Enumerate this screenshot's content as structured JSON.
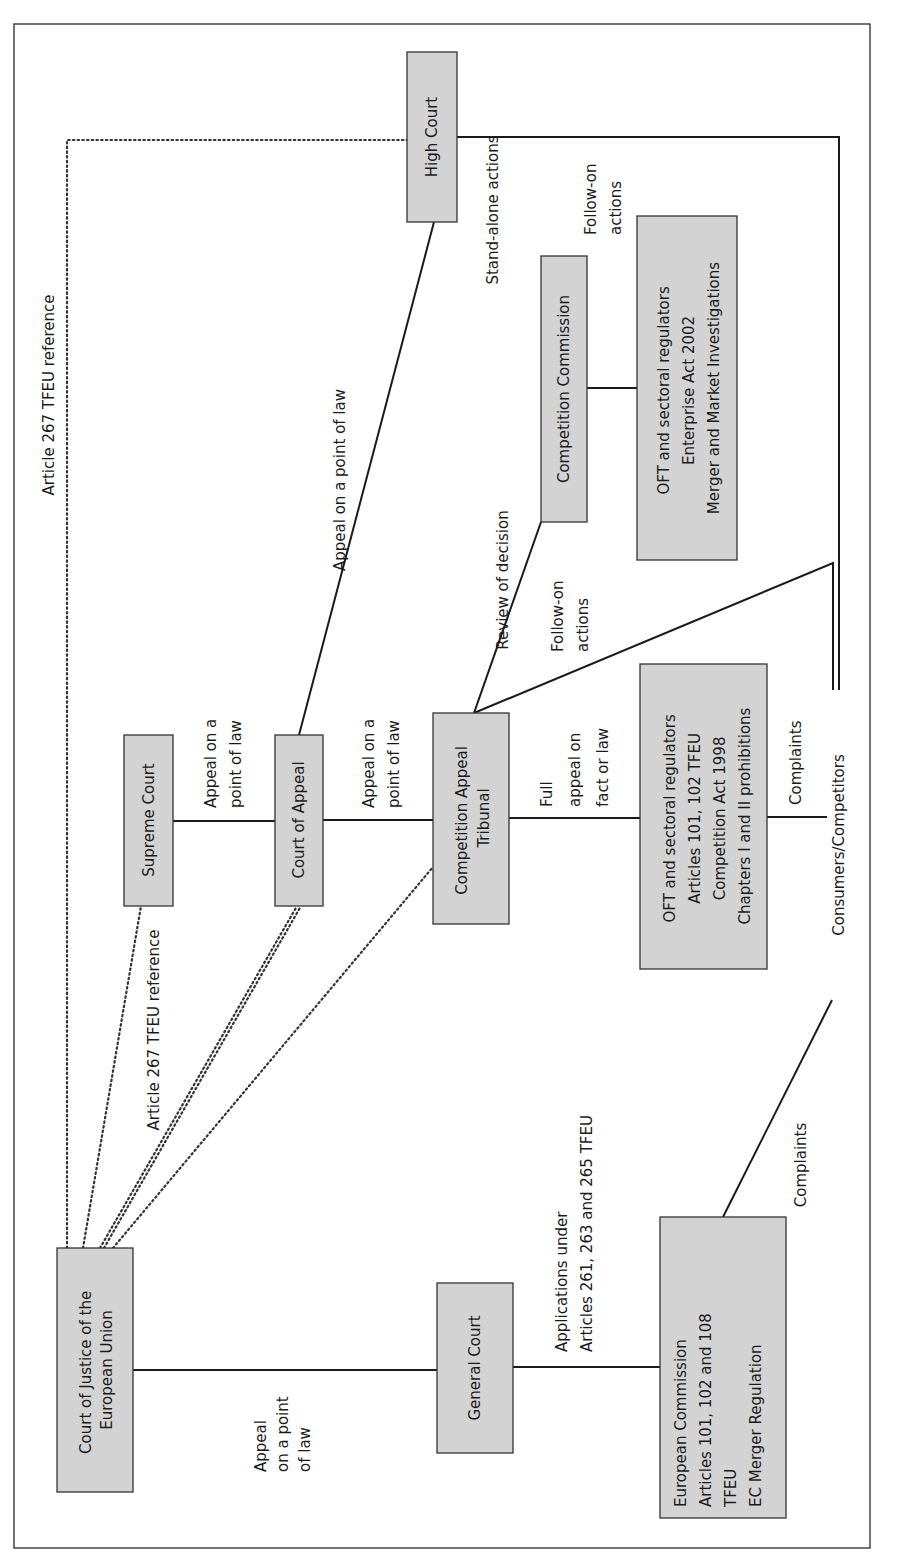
{
  "diagram": {
    "orientation": "rotated 90 degrees counter-clockwise",
    "colors": {
      "box_fill": "#d3d3d3",
      "line": "#1a1a1a",
      "background": "#ffffff"
    },
    "nodes": {
      "cjeu": {
        "lines": [
          "Court of Justice of the",
          "European Union"
        ]
      },
      "general_court": {
        "lines": [
          "General Court"
        ]
      },
      "european_commission": {
        "lines": [
          "European Commission",
          "Articles 101, 102 and 108",
          "TFEU",
          "EC Merger Regulation"
        ]
      },
      "supreme_court": {
        "lines": [
          "Supreme Court"
        ]
      },
      "court_of_appeal": {
        "lines": [
          "Court of Appeal"
        ]
      },
      "cat": {
        "lines": [
          "Competition Appeal",
          "Tribunal"
        ]
      },
      "oft_ca98": {
        "lines": [
          "OFT and sectoral regulators",
          "Articles 101, 102 TFEU",
          "Competition Act 1998",
          "Chapters I and II prohibitions"
        ]
      },
      "consumers": {
        "lines": [
          "Consumers/Competitors"
        ]
      },
      "high_court": {
        "lines": [
          "High Court"
        ]
      },
      "competition_commission": {
        "lines": [
          "Competition Commission"
        ]
      },
      "oft_ea02": {
        "lines": [
          "OFT and sectoral regulators",
          "Enterprise Act 2002",
          "Merger and Market Investigations"
        ]
      }
    },
    "edge_labels": {
      "article267_top": [
        "Article 267 TFEU reference"
      ],
      "article267_lower": [
        "Article 267 TFEU reference"
      ],
      "cjeu_gc_appeal": [
        "Appeal",
        "on a point",
        "of law"
      ],
      "gc_ec_applications": [
        "Applications under",
        "Articles 261, 263 and 265 TFEU"
      ],
      "ec_complaints": [
        "Complaints"
      ],
      "sc_ca_appeal": [
        "Appeal on a",
        "point of law"
      ],
      "ca_cat_appeal": [
        "Appeal on a",
        "point of law"
      ],
      "cat_oft_full_appeal": [
        "Full",
        "appeal on",
        "fact or law"
      ],
      "oft_complaints": [
        "Complaints"
      ],
      "ca_hc_appeal": [
        "Appeal on a point of law"
      ],
      "review_of_decision": [
        "Review of decision"
      ],
      "cat_follow_on": [
        "Follow-on",
        "actions"
      ],
      "stand_alone": [
        "Stand-alone actions"
      ],
      "hc_follow_on": [
        "Follow-on",
        "actions"
      ]
    }
  }
}
